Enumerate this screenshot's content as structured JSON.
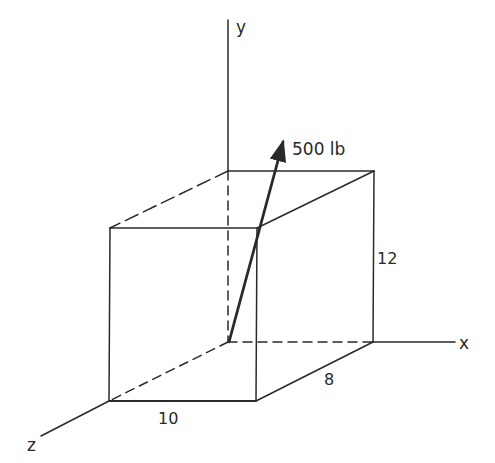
{
  "diagram": {
    "axes": {
      "x_label": "x",
      "y_label": "y",
      "z_label": "z"
    },
    "box": {
      "width_x": "8",
      "height_y": "12",
      "depth_z": "10"
    },
    "force": {
      "label": "500 lb",
      "magnitude": 500,
      "unit": "lb"
    },
    "colors": {
      "line": "#2a2a2a",
      "background": "#ffffff"
    }
  }
}
